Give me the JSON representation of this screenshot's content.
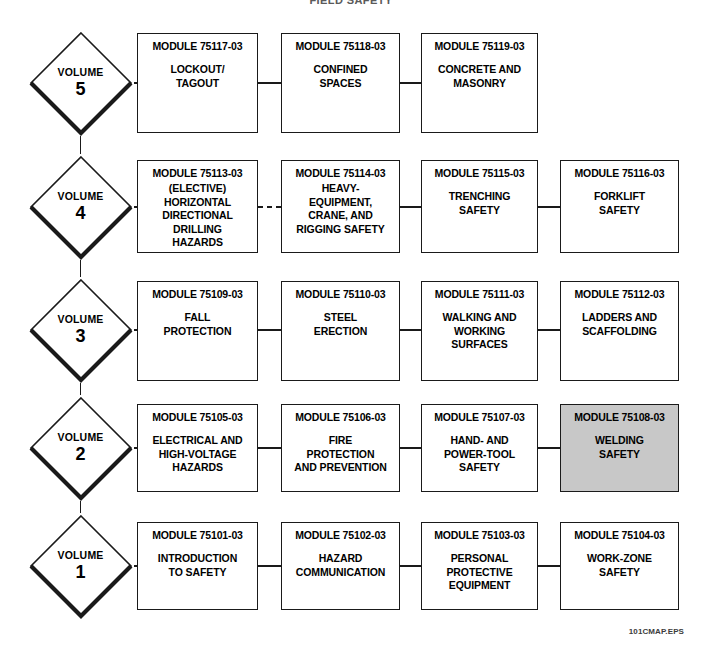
{
  "title": "FIELD SAFETY",
  "caption": "101CMAP.EPS",
  "colors": {
    "line": "#1a1a1a",
    "box_fill": "#ffffff",
    "highlight_fill": "#c8c8c8",
    "text": "#000000",
    "caption_text": "#3c3c3c"
  },
  "legend": {
    "elective_note": "(ELECTIVE)"
  },
  "rows": [
    {
      "volume": {
        "word": "VOLUME",
        "number": "5"
      },
      "connector_style": "solid",
      "modules": [
        {
          "id": "MODULE 75117-03",
          "title": "LOCKOUT/\nTAGOUT",
          "highlighted": false,
          "connector_before": "solid"
        },
        {
          "id": "MODULE 75118-03",
          "title": "CONFINED\nSPACES",
          "highlighted": false,
          "connector_before": "solid"
        },
        {
          "id": "MODULE 75119-03",
          "title": "CONCRETE AND\nMASONRY",
          "highlighted": false,
          "connector_before": "solid"
        }
      ]
    },
    {
      "volume": {
        "word": "VOLUME",
        "number": "4"
      },
      "connector_style": "dashed",
      "modules": [
        {
          "id": "MODULE 75113-03",
          "title": "(ELECTIVE)\nHORIZONTAL\nDIRECTIONAL\nDRILLING\nHAZARDS",
          "highlighted": false,
          "connector_before": "dashed"
        },
        {
          "id": "MODULE 75114-03",
          "title": "HEAVY-\nEQUIPMENT,\nCRANE, AND\nRIGGING SAFETY",
          "highlighted": false,
          "connector_before": "dashed"
        },
        {
          "id": "MODULE 75115-03",
          "title": "TRENCHING\nSAFETY",
          "highlighted": false,
          "connector_before": "solid"
        },
        {
          "id": "MODULE 75116-03",
          "title": "FORKLIFT\nSAFETY",
          "highlighted": false,
          "connector_before": "solid"
        }
      ]
    },
    {
      "volume": {
        "word": "VOLUME",
        "number": "3"
      },
      "connector_style": "solid",
      "modules": [
        {
          "id": "MODULE 75109-03",
          "title": "FALL\nPROTECTION",
          "highlighted": false,
          "connector_before": "solid"
        },
        {
          "id": "MODULE 75110-03",
          "title": "STEEL\nERECTION",
          "highlighted": false,
          "connector_before": "solid"
        },
        {
          "id": "MODULE 75111-03",
          "title": "WALKING AND\nWORKING\nSURFACES",
          "highlighted": false,
          "connector_before": "solid"
        },
        {
          "id": "MODULE 75112-03",
          "title": "LADDERS AND\nSCAFFOLDING",
          "highlighted": false,
          "connector_before": "solid"
        }
      ]
    },
    {
      "volume": {
        "word": "VOLUME",
        "number": "2"
      },
      "connector_style": "solid",
      "modules": [
        {
          "id": "MODULE 75105-03",
          "title": "ELECTRICAL AND\nHIGH-VOLTAGE\nHAZARDS",
          "highlighted": false,
          "connector_before": "solid"
        },
        {
          "id": "MODULE 75106-03",
          "title": "FIRE\nPROTECTION\nAND PREVENTION",
          "highlighted": false,
          "connector_before": "solid"
        },
        {
          "id": "MODULE 75107-03",
          "title": "HAND- AND\nPOWER-TOOL\nSAFETY",
          "highlighted": false,
          "connector_before": "solid"
        },
        {
          "id": "MODULE 75108-03",
          "title": "WELDING\nSAFETY",
          "highlighted": true,
          "connector_before": "solid"
        }
      ]
    },
    {
      "volume": {
        "word": "VOLUME",
        "number": "1"
      },
      "connector_style": "solid",
      "modules": [
        {
          "id": "MODULE 75101-03",
          "title": "INTRODUCTION\nTO SAFETY",
          "highlighted": false,
          "connector_before": "solid"
        },
        {
          "id": "MODULE 75102-03",
          "title": "HAZARD\nCOMMUNICATION",
          "highlighted": false,
          "connector_before": "solid"
        },
        {
          "id": "MODULE 75103-03",
          "title": "PERSONAL\nPROTECTIVE\nEQUIPMENT",
          "highlighted": false,
          "connector_before": "solid"
        },
        {
          "id": "MODULE 75104-03",
          "title": "WORK-ZONE\nSAFETY",
          "highlighted": false,
          "connector_before": "solid"
        }
      ]
    }
  ]
}
